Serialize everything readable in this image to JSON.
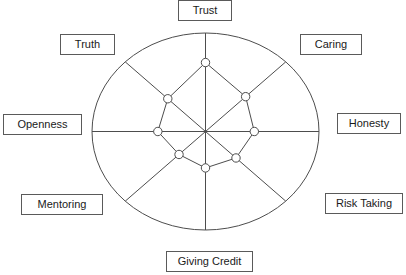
{
  "chart_data": {
    "type": "radar",
    "title": "",
    "subtitle": "",
    "xlabel": "",
    "ylabel": "",
    "legend": [],
    "grid": false,
    "outline_shape": "ellipse",
    "axis_count": 8,
    "rmin": 0,
    "rmax": 1,
    "categories": [
      "Trust",
      "Caring",
      "Honesty",
      "Risk Taking",
      "Giving Credit",
      "Mentoring",
      "Openness",
      "Truth"
    ],
    "values": [
      0.7,
      0.5,
      0.43,
      0.38,
      0.37,
      0.33,
      0.42,
      0.47
    ],
    "series": [
      {
        "name": "",
        "values": [
          0.7,
          0.5,
          0.43,
          0.38,
          0.37,
          0.33,
          0.42,
          0.47
        ]
      }
    ],
    "point_marker": "circle-open",
    "colors": {
      "outline": "#4d4d4d",
      "axis": "#4d4d4d",
      "series_line": "#4d4d4d",
      "marker_fill": "#ffffff",
      "marker_stroke": "#4d4d4d",
      "label_border": "#5a5a5a",
      "label_text": "#1a1a1a",
      "background": "#ffffff"
    }
  },
  "labels": {
    "trust": "Trust",
    "caring": "Caring",
    "honesty": "Honesty",
    "risk_taking": "Risk Taking",
    "giving_credit": "Giving Credit",
    "mentoring": "Mentoring",
    "openness": "Openness",
    "truth": "Truth"
  }
}
